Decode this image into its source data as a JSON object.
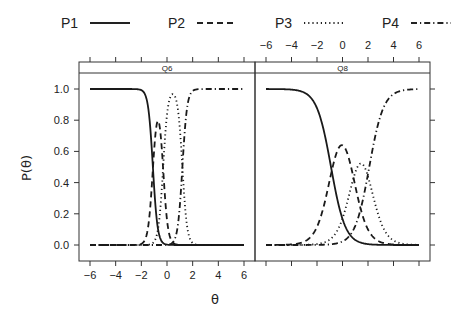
{
  "chart_data": {
    "type": "line",
    "title": "",
    "xlabel": "θ",
    "ylabel": "P(θ)",
    "xlim": [
      -6,
      6
    ],
    "ylim": [
      0,
      1
    ],
    "x_ticks": [
      -6,
      -4,
      -2,
      0,
      2,
      4,
      6
    ],
    "x_tick_labels": [
      "−6",
      "−4",
      "−2",
      "0",
      "2",
      "4",
      "6"
    ],
    "y_ticks": [
      0.0,
      0.2,
      0.4,
      0.6,
      0.8,
      1.0
    ],
    "y_tick_labels": [
      "0.0",
      "0.2",
      "0.4",
      "0.6",
      "0.8",
      "1.0"
    ],
    "legend": {
      "position": "top",
      "entries": [
        {
          "label": "P1",
          "style": "solid"
        },
        {
          "label": "P2",
          "style": "dashed"
        },
        {
          "label": "P3",
          "style": "dotted"
        },
        {
          "label": "P4",
          "style": "dashdot"
        }
      ]
    },
    "panels": [
      {
        "label": "Q6",
        "model": {
          "a": 3.2,
          "b": [
            -1.1,
            -0.3,
            1.2
          ]
        },
        "series": [
          {
            "name": "P1",
            "description": "decreasing from 1.0, crosses 0.5 near θ=-1.1"
          },
          {
            "name": "P2",
            "peak": 0.67,
            "peak_at": -0.8
          },
          {
            "name": "P3",
            "peak": 0.7,
            "peak_at": 0.4
          },
          {
            "name": "P4",
            "description": "increasing to 1.0, crosses 0.5 near θ=1.2"
          }
        ]
      },
      {
        "label": "Q8",
        "model": {
          "a": 1.05,
          "b": [
            -0.9,
            0.8,
            2.1
          ]
        },
        "series": [
          {
            "name": "P1",
            "description": "decreasing from ~0.99, crosses 0.5 near θ=-0.9"
          },
          {
            "name": "P2",
            "peak": 0.51,
            "peak_at": -0.2
          },
          {
            "name": "P3",
            "peak": 0.37,
            "peak_at": 1.4
          },
          {
            "name": "P4",
            "description": "increasing to ~0.98, crosses 0.5 near θ=2.1"
          }
        ]
      }
    ],
    "grid": false,
    "layout": "lattice two panels side by side, shared y axis; bottom x axis on left panel, top x axis on right panel; y tick labels on left, ticks on right"
  }
}
